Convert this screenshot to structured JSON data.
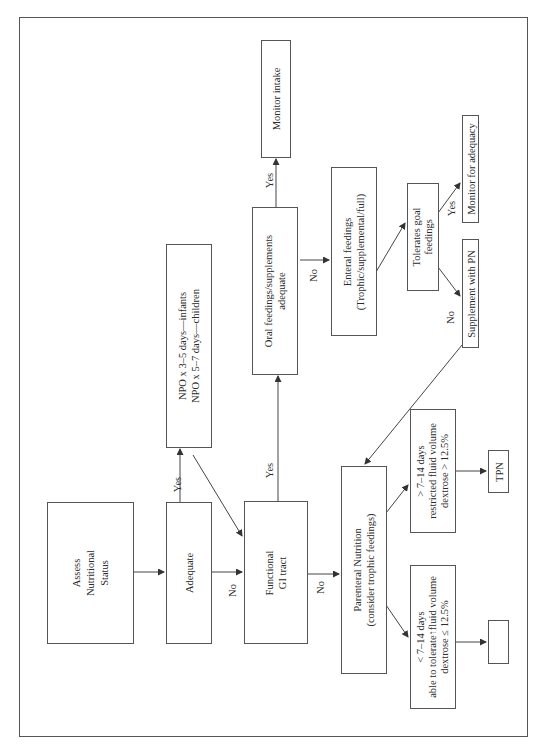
{
  "diagram": {
    "type": "flowchart",
    "orientation": "rotated-90-ccw",
    "nodes": {
      "assess": [
        "Assess",
        "Nutritional",
        "Status"
      ],
      "adequate": [
        "Adequate"
      ],
      "npo": [
        "NPO x 3–5 days—infants",
        "NPO x 5–7 days—children"
      ],
      "functional_gi": [
        "Functional",
        "GI tract"
      ],
      "oral": [
        "Oral feedings/supplements",
        "adequate"
      ],
      "monitor_intake": [
        "Monitor intake"
      ],
      "enteral": [
        "Enteral feedings",
        "(Trophic/supplemental/full)"
      ],
      "tolerates": [
        "Tolerates goal",
        "feedings"
      ],
      "monitor_adequacy": [
        "Monitor for adequacy"
      ],
      "supplement_pn": [
        "Supplement with PN"
      ],
      "parenteral": [
        "Parenteral Nutrition",
        "(consider trophic feedings)"
      ],
      "gt_7_14": [
        "> 7–14 days",
        "restricted fluid volume",
        "dextrose > 12.5%"
      ],
      "tpn": [
        "TPN"
      ],
      "lt_7_14": [
        "< 7–14 days",
        "able to tolerate↑fluid volume",
        "dextrose ≤ 12.5%"
      ],
      "empty": [
        ""
      ]
    },
    "edge_labels": {
      "adequate_yes": "Yes",
      "adequate_no": "No",
      "gi_yes": "Yes",
      "gi_no": "No",
      "oral_yes": "Yes",
      "oral_no": "No",
      "tolerates_yes": "Yes",
      "tolerates_no": "No"
    },
    "edges": [
      {
        "from": "assess",
        "to": "adequate"
      },
      {
        "from": "adequate",
        "to": "npo",
        "label": "Yes"
      },
      {
        "from": "adequate",
        "to": "functional_gi",
        "label": "No"
      },
      {
        "from": "npo",
        "to": "functional_gi"
      },
      {
        "from": "functional_gi",
        "to": "oral",
        "label": "Yes"
      },
      {
        "from": "functional_gi",
        "to": "parenteral",
        "label": "No"
      },
      {
        "from": "oral",
        "to": "monitor_intake",
        "label": "Yes"
      },
      {
        "from": "oral",
        "to": "enteral",
        "label": "No"
      },
      {
        "from": "enteral",
        "to": "tolerates"
      },
      {
        "from": "tolerates",
        "to": "monitor_adequacy",
        "label": "Yes"
      },
      {
        "from": "tolerates",
        "to": "supplement_pn",
        "label": "No"
      },
      {
        "from": "supplement_pn",
        "to": "parenteral"
      },
      {
        "from": "parenteral",
        "to": "gt_7_14"
      },
      {
        "from": "parenteral",
        "to": "lt_7_14"
      },
      {
        "from": "gt_7_14",
        "to": "tpn"
      },
      {
        "from": "lt_7_14",
        "to": "empty"
      }
    ]
  }
}
